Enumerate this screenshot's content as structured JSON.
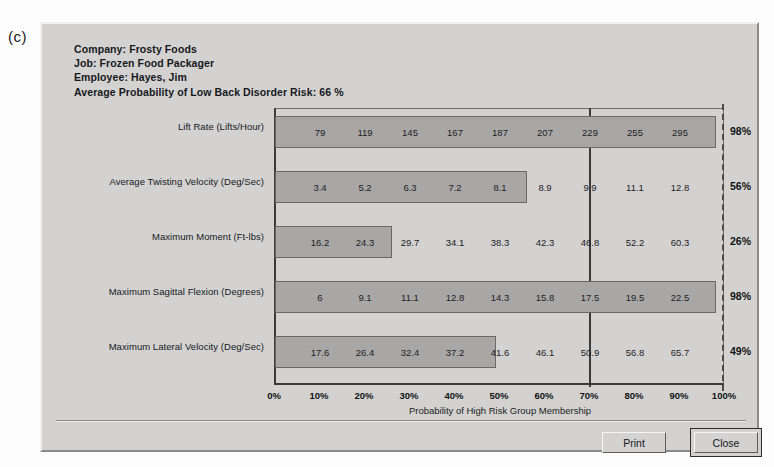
{
  "figure_label": "(c)",
  "header": {
    "company": "Company: Frosty Foods",
    "job": "Job: Frozen Food Packager",
    "employee": "Employee: Hayes, Jim",
    "average": "Average Probability of Low Back Disorder Risk: 66 %"
  },
  "buttons": {
    "print": "Print",
    "close": "Close"
  },
  "chart_data": {
    "type": "bar",
    "title": "",
    "xlabel": "Probability of High Risk Group Membership",
    "ylabel": "",
    "xlim": [
      0,
      100
    ],
    "xticks": [
      "0%",
      "10%",
      "20%",
      "30%",
      "40%",
      "50%",
      "60%",
      "70%",
      "80%",
      "90%",
      "100%"
    ],
    "xtick_values": [
      0,
      10,
      20,
      30,
      40,
      50,
      60,
      70,
      80,
      90,
      100
    ],
    "grid": false,
    "orientation": "horizontal",
    "reference_lines": [
      {
        "value": 70,
        "style": "solid"
      },
      {
        "value": 100,
        "style": "dashed"
      }
    ],
    "categories": [
      "Lift Rate (Lifts/Hour)",
      "Average Twisting Velocity (Deg/Sec)",
      "Maximum Moment (Ft-lbs)",
      "Maximum Sagittal Flexion (Degrees)",
      "Maximum Lateral Velocity (Deg/Sec)"
    ],
    "values": [
      98,
      56,
      26,
      98,
      49
    ],
    "value_labels": [
      "98%",
      "56%",
      "26%",
      "98%",
      "49%"
    ],
    "scale_markers": {
      "positions": [
        10,
        20,
        30,
        40,
        50,
        60,
        70,
        80,
        90
      ],
      "rows": [
        [
          "79",
          "119",
          "145",
          "167",
          "187",
          "207",
          "229",
          "255",
          "295"
        ],
        [
          "3.4",
          "5.2",
          "6.3",
          "7.2",
          "8.1",
          "8.9",
          "9.9",
          "11.1",
          "12.8"
        ],
        [
          "16.2",
          "24.3",
          "29.7",
          "34.1",
          "38.3",
          "42.3",
          "46.8",
          "52.2",
          "60.3"
        ],
        [
          "6",
          "9.1",
          "11.1",
          "12.8",
          "14.3",
          "15.8",
          "17.5",
          "19.5",
          "22.5"
        ],
        [
          "17.6",
          "26.4",
          "32.4",
          "37.2",
          "41.6",
          "46.1",
          "50.9",
          "56.8",
          "65.7"
        ]
      ]
    },
    "colors": {
      "bar": "#a9a7a5",
      "background": "#d4d2d0",
      "axis": "#3a3a3a",
      "text": "#15181c"
    }
  }
}
